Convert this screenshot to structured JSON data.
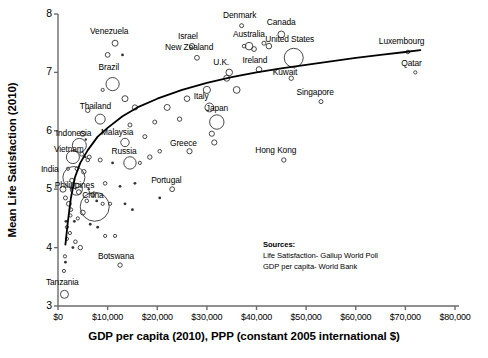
{
  "chart_data": {
    "type": "scatter",
    "title": "",
    "xlabel": "GDP per capita (2010), PPP (constant 2005 international $)",
    "ylabel": "Mean Life Satisfaction (2010)",
    "xlim": [
      0,
      80000
    ],
    "ylim": [
      3,
      8
    ],
    "grid": false,
    "legend": "none",
    "xticks": [
      "$0",
      "$10,000",
      "$20,000",
      "$30,000",
      "$40,000",
      "$50,000",
      "$60,000",
      "$70,000",
      "$80,000"
    ],
    "xtick_values": [
      0,
      10000,
      20000,
      30000,
      40000,
      50000,
      60000,
      70000,
      80000
    ],
    "yticks": [
      "3",
      "4",
      "5",
      "6",
      "7",
      "8"
    ],
    "ytick_values": [
      3,
      4,
      5,
      6,
      7,
      8
    ],
    "marker": "open-circle",
    "marker_size_encodes": "population",
    "trendline": {
      "type": "logarithmic",
      "description": "fitted log curve rising from lower-left to upper-right",
      "points": [
        [
          1500,
          4.05
        ],
        [
          2000,
          4.45
        ],
        [
          2600,
          4.85
        ],
        [
          3400,
          5.2
        ],
        [
          4500,
          5.45
        ],
        [
          6000,
          5.67
        ],
        [
          8000,
          5.9
        ],
        [
          10000,
          6.05
        ],
        [
          13000,
          6.25
        ],
        [
          16000,
          6.4
        ],
        [
          20000,
          6.55
        ],
        [
          25000,
          6.7
        ],
        [
          30000,
          6.82
        ],
        [
          35000,
          6.92
        ],
        [
          40000,
          7.0
        ],
        [
          45000,
          7.07
        ],
        [
          50000,
          7.13
        ],
        [
          55000,
          7.19
        ],
        [
          60000,
          7.25
        ],
        [
          65000,
          7.3
        ],
        [
          70000,
          7.35
        ],
        [
          73000,
          7.38
        ]
      ]
    },
    "labeled_points": [
      {
        "name": "Venezuela",
        "x": 11500,
        "y": 7.5,
        "label_dx": -6,
        "label_dy": -9,
        "r": 3.0
      },
      {
        "name": "Denmark",
        "x": 37000,
        "y": 7.8,
        "label_dx": -2,
        "label_dy": -9,
        "r": 2.0
      },
      {
        "name": "Canada",
        "x": 45000,
        "y": 7.65,
        "label_dx": 0,
        "label_dy": -9,
        "r": 3.4
      },
      {
        "name": "Israel",
        "x": 27000,
        "y": 7.45,
        "label_dx": -4,
        "label_dy": -8,
        "r": 2.6
      },
      {
        "name": "Australia",
        "x": 38500,
        "y": 7.45,
        "label_dx": 0,
        "label_dy": -8,
        "r": 3.8
      },
      {
        "name": "New Zealand",
        "x": 28000,
        "y": 7.25,
        "label_dx": -8,
        "label_dy": -8,
        "r": 2.4
      },
      {
        "name": "United States",
        "x": 47500,
        "y": 7.25,
        "label_dx": -4,
        "label_dy": -9,
        "r": 9.5
      },
      {
        "name": "U.K.",
        "x": 34500,
        "y": 7.0,
        "label_dx": -8,
        "label_dy": -7,
        "r": 3.3
      },
      {
        "name": "Ireland",
        "x": 40500,
        "y": 7.05,
        "label_dx": -4,
        "label_dy": -7,
        "r": 2.8
      },
      {
        "name": "Luxembourg",
        "x": 70500,
        "y": 7.35,
        "label_dx": -6,
        "label_dy": -9,
        "r": 1.8
      },
      {
        "name": "Qatar",
        "x": 72000,
        "y": 7.0,
        "label_dx": -4,
        "label_dy": -8,
        "r": 1.6
      },
      {
        "name": "Kuwait",
        "x": 47000,
        "y": 6.9,
        "label_dx": -6,
        "label_dy": -4,
        "r": 2.2
      },
      {
        "name": "Singapore",
        "x": 53000,
        "y": 6.5,
        "label_dx": -6,
        "label_dy": -8,
        "r": 2.0
      },
      {
        "name": "Brazil",
        "x": 11000,
        "y": 6.8,
        "label_dx": -4,
        "label_dy": -10,
        "r": 6.6
      },
      {
        "name": "Thailand",
        "x": 8500,
        "y": 6.2,
        "label_dx": -5,
        "label_dy": -8,
        "r": 5.0
      },
      {
        "name": "Italy",
        "x": 30500,
        "y": 6.4,
        "label_dx": -8,
        "label_dy": -7,
        "r": 4.4
      },
      {
        "name": "Japan",
        "x": 32000,
        "y": 6.15,
        "label_dx": 0,
        "label_dy": -7,
        "r": 7.2
      },
      {
        "name": "Hong Kong",
        "x": 45500,
        "y": 5.5,
        "label_dx": -8,
        "label_dy": -8,
        "r": 2.2
      },
      {
        "name": "Greece",
        "x": 26500,
        "y": 5.65,
        "label_dx": -6,
        "label_dy": -6,
        "r": 2.6
      },
      {
        "name": "Indonesia",
        "x": 4300,
        "y": 5.75,
        "label_dx": -6,
        "label_dy": -5,
        "r": 7.0
      },
      {
        "name": "Malaysia",
        "x": 13500,
        "y": 5.8,
        "label_dx": -8,
        "label_dy": -6,
        "r": 4.2
      },
      {
        "name": "Vietnam",
        "x": 3000,
        "y": 5.55,
        "label_dx": -4,
        "label_dy": -2,
        "r": 6.5
      },
      {
        "name": "India",
        "x": 3200,
        "y": 5.2,
        "label_dx": -24,
        "label_dy": 2,
        "r": 11.0
      },
      {
        "name": "Russia",
        "x": 14500,
        "y": 5.45,
        "label_dx": -6,
        "label_dy": -6,
        "r": 6.2
      },
      {
        "name": "Philippines",
        "x": 3700,
        "y": 5.0,
        "label_dx": -2,
        "label_dy": 2,
        "r": 6.0
      },
      {
        "name": "Portugal",
        "x": 23000,
        "y": 5.0,
        "label_dx": -6,
        "label_dy": -7,
        "r": 2.4
      },
      {
        "name": "China",
        "x": 7400,
        "y": 4.7,
        "label_dx": -2,
        "label_dy": 3,
        "r": 14.5
      },
      {
        "name": "Botswana",
        "x": 12500,
        "y": 3.7,
        "label_dx": -4,
        "label_dy": -7,
        "r": 2.2
      },
      {
        "name": "Tanzania",
        "x": 1300,
        "y": 3.2,
        "label_dx": -2,
        "label_dy": -8,
        "r": 4.0
      }
    ],
    "unlabeled_points": [
      {
        "x": 10000,
        "y": 7.3,
        "r": 2.4
      },
      {
        "x": 13000,
        "y": 7.3,
        "r": 1.4
      },
      {
        "x": 9000,
        "y": 6.7,
        "r": 1.6
      },
      {
        "x": 13500,
        "y": 6.55,
        "r": 3.0
      },
      {
        "x": 15500,
        "y": 6.4,
        "r": 2.6
      },
      {
        "x": 6000,
        "y": 6.35,
        "r": 2.2
      },
      {
        "x": 14500,
        "y": 6.1,
        "r": 2.0
      },
      {
        "x": 22000,
        "y": 6.4,
        "r": 3.0
      },
      {
        "x": 26000,
        "y": 6.55,
        "r": 2.8
      },
      {
        "x": 30000,
        "y": 6.7,
        "r": 3.6
      },
      {
        "x": 24500,
        "y": 6.2,
        "r": 2.2
      },
      {
        "x": 19500,
        "y": 6.15,
        "r": 2.0
      },
      {
        "x": 31000,
        "y": 5.95,
        "r": 2.6
      },
      {
        "x": 31500,
        "y": 5.8,
        "r": 2.6
      },
      {
        "x": 36000,
        "y": 6.7,
        "r": 3.4
      },
      {
        "x": 34000,
        "y": 6.9,
        "r": 3.0
      },
      {
        "x": 39500,
        "y": 7.4,
        "r": 2.4
      },
      {
        "x": 41500,
        "y": 7.5,
        "r": 2.0
      },
      {
        "x": 42500,
        "y": 7.45,
        "r": 2.8
      },
      {
        "x": 37500,
        "y": 7.45,
        "r": 1.8
      },
      {
        "x": 20500,
        "y": 5.65,
        "r": 1.8
      },
      {
        "x": 18500,
        "y": 5.55,
        "r": 2.2
      },
      {
        "x": 17500,
        "y": 5.9,
        "r": 2.0
      },
      {
        "x": 16500,
        "y": 5.45,
        "r": 1.6
      },
      {
        "x": 11000,
        "y": 5.45,
        "r": 1.4
      },
      {
        "x": 8500,
        "y": 5.5,
        "r": 2.0
      },
      {
        "x": 6000,
        "y": 5.5,
        "r": 1.8
      },
      {
        "x": 5200,
        "y": 5.3,
        "r": 2.2
      },
      {
        "x": 9500,
        "y": 5.1,
        "r": 1.8
      },
      {
        "x": 12500,
        "y": 5.05,
        "r": 1.4
      },
      {
        "x": 15500,
        "y": 5.1,
        "r": 1.4
      },
      {
        "x": 7000,
        "y": 4.9,
        "r": 2.0
      },
      {
        "x": 9000,
        "y": 4.75,
        "r": 1.6
      },
      {
        "x": 10500,
        "y": 4.75,
        "r": 1.6
      },
      {
        "x": 5000,
        "y": 4.6,
        "r": 2.4
      },
      {
        "x": 4000,
        "y": 4.5,
        "r": 1.6
      },
      {
        "x": 6500,
        "y": 4.4,
        "r": 1.4
      },
      {
        "x": 8000,
        "y": 4.35,
        "r": 1.4
      },
      {
        "x": 9500,
        "y": 4.2,
        "r": 1.6
      },
      {
        "x": 11500,
        "y": 4.2,
        "r": 1.6
      },
      {
        "x": 3500,
        "y": 4.1,
        "r": 1.8
      },
      {
        "x": 4500,
        "y": 4.0,
        "r": 2.2
      },
      {
        "x": 3000,
        "y": 4.0,
        "r": 1.4
      },
      {
        "x": 1800,
        "y": 4.15,
        "r": 1.6
      },
      {
        "x": 1400,
        "y": 3.85,
        "r": 1.6
      },
      {
        "x": 1500,
        "y": 3.75,
        "r": 1.4
      },
      {
        "x": 1200,
        "y": 3.6,
        "r": 1.6
      },
      {
        "x": 2500,
        "y": 4.55,
        "r": 1.6
      },
      {
        "x": 1800,
        "y": 4.35,
        "r": 1.6
      },
      {
        "x": 2200,
        "y": 4.75,
        "r": 2.4
      },
      {
        "x": 1500,
        "y": 4.85,
        "r": 2.0
      },
      {
        "x": 1000,
        "y": 5.0,
        "r": 3.0
      },
      {
        "x": 2800,
        "y": 5.15,
        "r": 2.2
      },
      {
        "x": 2000,
        "y": 5.35,
        "r": 1.6
      },
      {
        "x": 3800,
        "y": 5.35,
        "r": 1.8
      },
      {
        "x": 4800,
        "y": 5.6,
        "r": 2.0
      },
      {
        "x": 5500,
        "y": 5.55,
        "r": 1.2
      },
      {
        "x": 6300,
        "y": 5.55,
        "r": 2.0
      },
      {
        "x": 5000,
        "y": 5.95,
        "r": 2.6
      },
      {
        "x": 5600,
        "y": 5.85,
        "r": 1.2
      },
      {
        "x": 4200,
        "y": 4.95,
        "r": 2.4
      },
      {
        "x": 6200,
        "y": 5.0,
        "r": 1.2
      },
      {
        "x": 5800,
        "y": 4.8,
        "r": 1.8
      },
      {
        "x": 7800,
        "y": 4.8,
        "r": 1.4
      },
      {
        "x": 2600,
        "y": 4.65,
        "r": 1.8
      },
      {
        "x": 3300,
        "y": 4.45,
        "r": 1.4
      },
      {
        "x": 2400,
        "y": 4.25,
        "r": 1.6
      },
      {
        "x": 1600,
        "y": 4.45,
        "r": 1.4
      },
      {
        "x": 13500,
        "y": 4.75,
        "r": 1.4
      },
      {
        "x": 15000,
        "y": 4.65,
        "r": 1.4
      },
      {
        "x": 20500,
        "y": 4.85,
        "r": 1.4
      }
    ]
  },
  "axes": {
    "ylabel": "Mean Life Satisfaction (2010)",
    "xlabel": "GDP per capita (2010), PPP (constant 2005 international $)"
  },
  "sources": {
    "heading": "Sources:",
    "line1": "Life Satisfaction- Gallup World Poll",
    "line2": "GDP per capita- World Bank"
  },
  "colors": {
    "background": "#ffffff",
    "axis": "#6b6b6b",
    "marker": "#333333",
    "trendline": "#000000",
    "text": "#000000"
  }
}
